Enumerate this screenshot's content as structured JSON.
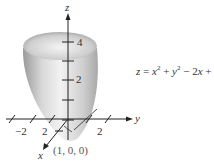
{
  "figure": {
    "equation": {
      "lhs": "z",
      "rhs_parts": [
        "x",
        "2",
        " + ",
        "y",
        "2",
        " − 2",
        "x",
        " + 1"
      ]
    },
    "axes": {
      "z_label": "z",
      "y_label": "y",
      "x_label": "x",
      "z_ticks": [
        "4",
        "2"
      ],
      "y_ticks": [
        "−2",
        "2"
      ],
      "x_ticks": [
        "2"
      ]
    },
    "vertex_label": "(1, 0, 0)",
    "colors": {
      "surface_light": "#e6e6e6",
      "surface_dark": "#8a8a8a",
      "axis": "#222222"
    }
  }
}
